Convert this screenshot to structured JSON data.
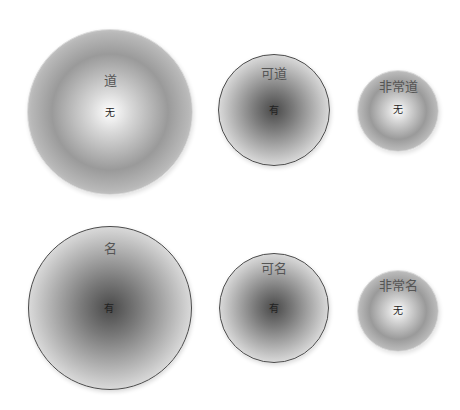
{
  "diagram": {
    "rows": [
      {
        "circles": [
          {
            "top_label": "道",
            "center_label": "无",
            "style": "wu",
            "cx": 110,
            "cy": 112,
            "r": 83,
            "top_y": 80
          },
          {
            "top_label": "可道",
            "center_label": "有",
            "style": "you",
            "cx": 274,
            "cy": 110,
            "r": 56,
            "top_y": 73
          },
          {
            "top_label": "非常道",
            "center_label": "无",
            "style": "wu",
            "cx": 398,
            "cy": 111,
            "r": 41,
            "top_y": 86
          }
        ]
      },
      {
        "circles": [
          {
            "top_label": "名",
            "center_label": "有",
            "style": "you",
            "cx": 110,
            "cy": 308,
            "r": 82,
            "top_y": 248
          },
          {
            "top_label": "可名",
            "center_label": "有",
            "style": "you",
            "cx": 274,
            "cy": 308,
            "r": 55,
            "top_y": 268
          },
          {
            "top_label": "非常名",
            "center_label": "无",
            "style": "wu",
            "cx": 398,
            "cy": 311,
            "r": 41,
            "top_y": 285
          }
        ]
      }
    ]
  },
  "colors": {
    "light_border": "#dcdcdc",
    "dark_border": "#4a4a4a",
    "label_text": "#555555",
    "center_text": "#222222"
  }
}
